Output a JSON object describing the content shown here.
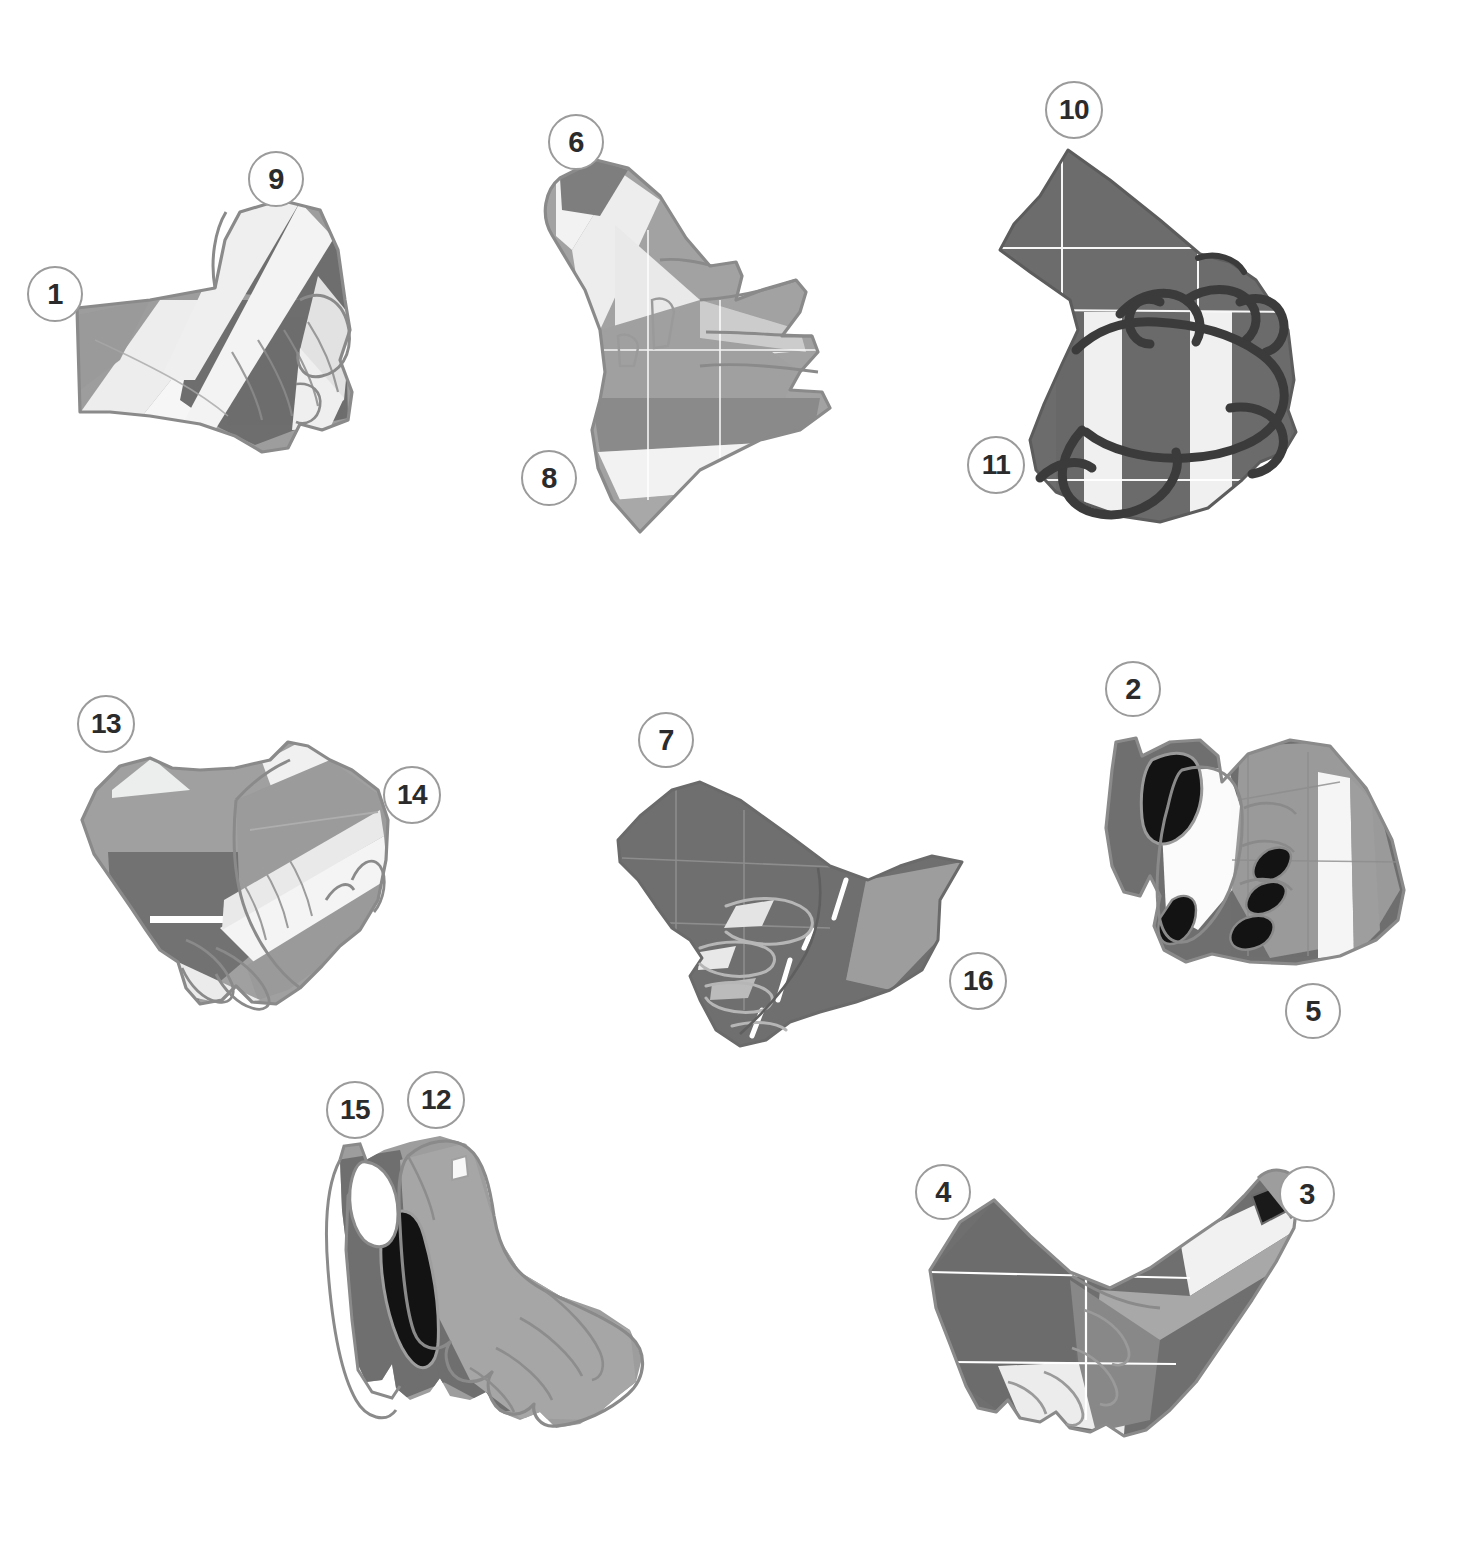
{
  "page": {
    "width": 1469,
    "height": 1553,
    "background": "#ffffff"
  },
  "style": {
    "callout_fill": "#ffffff",
    "callout_border": "#9b9b9b",
    "callout_text": "#2b2b2b",
    "outline": "#8a8a8a",
    "palette": {
      "near_white": "#f4f4f4",
      "light": "#e6e6e6",
      "light_mid": "#c9c9c9",
      "mid": "#a3a3a3",
      "mid_dark": "#8d8d8d",
      "dark": "#6f6f6f",
      "darker": "#5c5c5c",
      "black": "#141414",
      "grid": "#ffffff"
    }
  },
  "callouts": [
    {
      "id": "callout-1",
      "label": "1",
      "cx": 55,
      "cy": 294,
      "r": 28
    },
    {
      "id": "callout-9",
      "label": "9",
      "cx": 276,
      "cy": 179,
      "r": 28
    },
    {
      "id": "callout-6",
      "label": "6",
      "cx": 576,
      "cy": 142,
      "r": 28
    },
    {
      "id": "callout-8",
      "label": "8",
      "cx": 549,
      "cy": 478,
      "r": 28
    },
    {
      "id": "callout-10",
      "label": "10",
      "cx": 1074,
      "cy": 110,
      "r": 29
    },
    {
      "id": "callout-11",
      "label": "11",
      "cx": 996,
      "cy": 465,
      "r": 29
    },
    {
      "id": "callout-13",
      "label": "13",
      "cx": 106,
      "cy": 724,
      "r": 29
    },
    {
      "id": "callout-14",
      "label": "14",
      "cx": 412,
      "cy": 795,
      "r": 29
    },
    {
      "id": "callout-7",
      "label": "7",
      "cx": 666,
      "cy": 740,
      "r": 28
    },
    {
      "id": "callout-16",
      "label": "16",
      "cx": 978,
      "cy": 981,
      "r": 29
    },
    {
      "id": "callout-2",
      "label": "2",
      "cx": 1133,
      "cy": 689,
      "r": 28
    },
    {
      "id": "callout-5",
      "label": "5",
      "cx": 1313,
      "cy": 1011,
      "r": 28
    },
    {
      "id": "callout-15",
      "label": "15",
      "cx": 355,
      "cy": 1110,
      "r": 29
    },
    {
      "id": "callout-12",
      "label": "12",
      "cx": 436,
      "cy": 1100,
      "r": 29
    },
    {
      "id": "callout-4",
      "label": "4",
      "cx": 943,
      "cy": 1192,
      "r": 28
    },
    {
      "id": "callout-3",
      "label": "3",
      "cx": 1307,
      "cy": 1194,
      "r": 28
    }
  ],
  "figures": [
    {
      "id": "figure-top-left",
      "name": "glove-diagram-top-left",
      "callout_ids": [
        "callout-1",
        "callout-9"
      ]
    },
    {
      "id": "figure-top-center",
      "name": "glove-diagram-top-center",
      "callout_ids": [
        "callout-6",
        "callout-8"
      ]
    },
    {
      "id": "figure-top-right",
      "name": "glove-diagram-top-right",
      "callout_ids": [
        "callout-10",
        "callout-11"
      ]
    },
    {
      "id": "figure-mid-left",
      "name": "glove-diagram-mid-left",
      "callout_ids": [
        "callout-13",
        "callout-14"
      ]
    },
    {
      "id": "figure-mid-center",
      "name": "glove-diagram-mid-center",
      "callout_ids": [
        "callout-7",
        "callout-16"
      ]
    },
    {
      "id": "figure-mid-right",
      "name": "glove-diagram-mid-right",
      "callout_ids": [
        "callout-2",
        "callout-5"
      ]
    },
    {
      "id": "figure-bottom-left",
      "name": "glove-diagram-bottom-left",
      "callout_ids": [
        "callout-15",
        "callout-12"
      ]
    },
    {
      "id": "figure-bottom-right",
      "name": "glove-diagram-bottom-right",
      "callout_ids": [
        "callout-4",
        "callout-3"
      ]
    }
  ]
}
